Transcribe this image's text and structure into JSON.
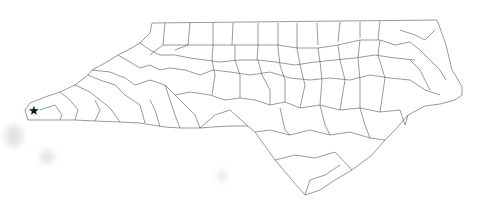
{
  "map": {
    "title": "",
    "region": "North Carolina counties",
    "stroke_color": "#555555",
    "fill_color": "#ffffff",
    "background": "#ffffff",
    "marker": {
      "icon": "star-icon",
      "glyph": "★",
      "color": "#111111",
      "x": 33,
      "y": 113
    }
  }
}
